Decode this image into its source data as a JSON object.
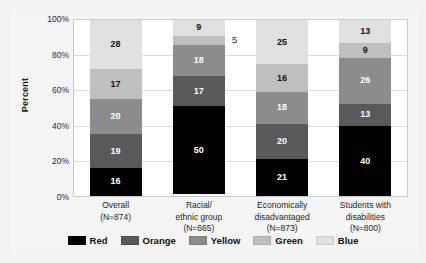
{
  "figure": {
    "cut_off_title": "",
    "y_axis_title": "Percent"
  },
  "chart_data": {
    "type": "bar",
    "subtype": "stacked-100-percent",
    "title": "",
    "xlabel": "",
    "ylabel": "Percent",
    "ylim": [
      0,
      100
    ],
    "ytick_labels": [
      "100%",
      "80%",
      "60%",
      "40%",
      "20%",
      "0%"
    ],
    "ytick_values": [
      100,
      80,
      60,
      40,
      20,
      0
    ],
    "grid": true,
    "legend_position": "bottom",
    "stack_order_bottom_to_top": [
      "Red",
      "Orange",
      "Yellow",
      "Green",
      "Blue"
    ],
    "categories": [
      "Overall (N=874)",
      "Racial/ethnic group (N=665)",
      "Economically disadvantaged (N=873)",
      "Students with disabilities (N=800)"
    ],
    "category_lines": [
      [
        "Overall",
        "(N=874)"
      ],
      [
        "Racial/",
        "ethnic group",
        "(N=665)"
      ],
      [
        "Economically",
        "disadvantaged",
        "(N=873)"
      ],
      [
        "Students with",
        "disabilities",
        "(N=800)"
      ]
    ],
    "series": [
      {
        "name": "Red",
        "color": "#000000",
        "values": [
          16,
          50,
          21,
          40
        ]
      },
      {
        "name": "Orange",
        "color": "#595959",
        "values": [
          19,
          17,
          20,
          13
        ]
      },
      {
        "name": "Yellow",
        "color": "#8c8c8c",
        "values": [
          20,
          18,
          18,
          26
        ]
      },
      {
        "name": "Green",
        "color": "#bfbfbf",
        "values": [
          17,
          5,
          16,
          9
        ]
      },
      {
        "name": "Blue",
        "color": "#e0e0e0",
        "values": [
          28,
          9,
          25,
          13
        ]
      }
    ],
    "labels_outside_bar": [
      {
        "category_index": 1,
        "series": "Green",
        "value": 5
      }
    ]
  },
  "legend": {
    "items": [
      {
        "label": "Red",
        "color": "#000000"
      },
      {
        "label": "Orange",
        "color": "#595959"
      },
      {
        "label": "Yellow",
        "color": "#8c8c8c"
      },
      {
        "label": "Green",
        "color": "#bfbfbf"
      },
      {
        "label": "Blue",
        "color": "#e0e0e0"
      }
    ]
  }
}
